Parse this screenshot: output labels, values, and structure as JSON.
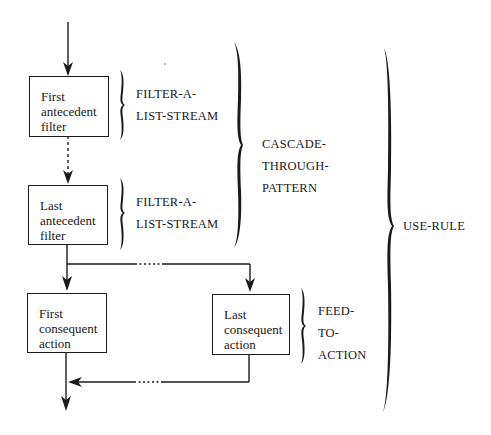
{
  "diagram": {
    "type": "flow-diagram",
    "boxes": {
      "first_antecedent": {
        "lines": [
          "First",
          "antecedent",
          "filter"
        ]
      },
      "last_antecedent": {
        "lines": [
          "Last",
          "antecedent",
          "filter"
        ]
      },
      "first_consequent": {
        "lines": [
          "First",
          "consequent",
          "action"
        ]
      },
      "last_consequent": {
        "lines": [
          "Last",
          "consequent",
          "action"
        ]
      }
    },
    "brace_labels": {
      "filter_a_list_stream_1": {
        "lines": [
          "FILTER-A-",
          "LIST-STREAM"
        ]
      },
      "filter_a_list_stream_2": {
        "lines": [
          "FILTER-A-",
          "LIST-STREAM"
        ]
      },
      "cascade_through_pattern": {
        "lines": [
          "CASCADE-",
          "THROUGH-",
          "PATTERN"
        ]
      },
      "feed_to_action": {
        "lines": [
          "FEED-",
          "TO-",
          "ACTION"
        ]
      },
      "use_rule": {
        "lines": [
          "USE-RULE"
        ]
      }
    },
    "colors": {
      "ink": "#1a1a1a",
      "background": "#ffffff"
    }
  }
}
